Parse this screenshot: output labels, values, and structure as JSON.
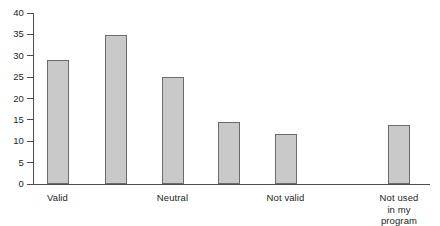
{
  "chart_data": {
    "type": "bar",
    "title": "",
    "subtitle": "",
    "xlabel": "",
    "ylabel": "",
    "ylim": [
      0,
      40
    ],
    "yticks": [
      0,
      5,
      10,
      15,
      20,
      25,
      30,
      35,
      40
    ],
    "ytick_labels": [
      "0",
      "5",
      "10",
      "15",
      "20",
      "25",
      "30",
      "35",
      "40"
    ],
    "grid": false,
    "legend": null,
    "legend_position": "none",
    "bar_color": "#c9c9c9",
    "bar_edge_color": "#6b6b6b",
    "axis_color": "#4d4d4d",
    "categories": [
      "Valid",
      "",
      "Neutral",
      "",
      "Not valid",
      "Not used\nin my program"
    ],
    "tick_labels": [
      {
        "text": "Valid",
        "bar_index": 0
      },
      {
        "text": "Neutral",
        "bar_index": 2
      },
      {
        "text": "Not valid",
        "bar_index": 4
      },
      {
        "text": "Not used\nin my program",
        "bar_index": 5
      }
    ],
    "values": [
      28.9,
      34.8,
      25.0,
      14.6,
      11.8,
      13.9
    ],
    "bars": [
      {
        "label": "Valid",
        "value": 28.9
      },
      {
        "label": "",
        "value": 34.8
      },
      {
        "label": "Neutral",
        "value": 25.0
      },
      {
        "label": "",
        "value": 14.6
      },
      {
        "label": "Not valid",
        "value": 11.8
      },
      {
        "label": "Not used in my program",
        "value": 13.9
      }
    ]
  }
}
